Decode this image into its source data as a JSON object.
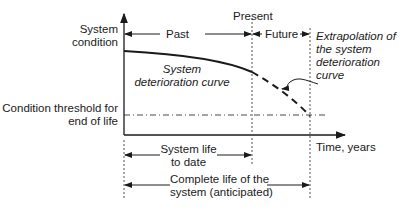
{
  "diagram": {
    "type": "system-life-deterioration",
    "y_axis_label": [
      "System",
      "condition"
    ],
    "x_axis_label": "Time, years",
    "threshold_label": [
      "Condition threshold for",
      "end of life"
    ],
    "present_label": "Present",
    "past_label": "Past",
    "future_label": "Future",
    "curve_label": [
      "System",
      "deterioration curve"
    ],
    "extrapolation_label": [
      "Extrapolation of",
      "the system",
      "deterioration",
      "curve"
    ],
    "life_to_date_label": [
      "System life",
      "to date"
    ],
    "complete_life_label": [
      "Complete life of the",
      "system (anticipated)"
    ]
  }
}
